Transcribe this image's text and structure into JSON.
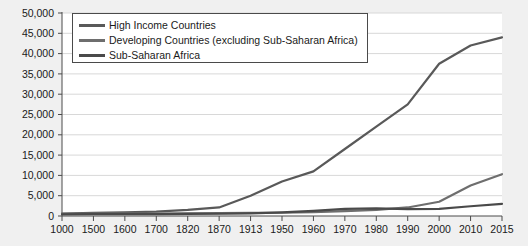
{
  "chart_data": {
    "type": "line",
    "title": "",
    "subtitle": "",
    "xlabel": "",
    "ylabel": "",
    "grid": true,
    "legend_position": "top-left",
    "categories": [
      "1000",
      "1500",
      "1600",
      "1700",
      "1820",
      "1870",
      "1913",
      "1950",
      "1960",
      "1970",
      "1980",
      "1990",
      "2000",
      "2010",
      "2015"
    ],
    "ylim": [
      0,
      50000
    ],
    "ytick_labels": [
      "0",
      "5,000",
      "10,000",
      "15,000",
      "20,000",
      "25,000",
      "30,000",
      "35,000",
      "40,000",
      "45,000",
      "50,000"
    ],
    "ytick_values": [
      0,
      5000,
      10000,
      15000,
      20000,
      25000,
      30000,
      35000,
      40000,
      45000,
      50000
    ],
    "series": [
      {
        "name": "High Income Countries",
        "color": "#595959",
        "values": [
          600,
          800,
          900,
          1100,
          1500,
          2100,
          5000,
          8500,
          11000,
          16500,
          22000,
          27500,
          37500,
          42000,
          44000
        ]
      },
      {
        "name": "Developing Countries (excluding Sub-Saharan Africa)",
        "color": "#6e6e6e",
        "values": [
          550,
          600,
          600,
          620,
          650,
          700,
          750,
          800,
          950,
          1200,
          1500,
          2100,
          3500,
          7500,
          10300
        ]
      },
      {
        "name": "Sub-Saharan Africa",
        "color": "#4a4a4a",
        "values": [
          420,
          450,
          450,
          480,
          500,
          550,
          650,
          900,
          1250,
          1750,
          1900,
          1700,
          1750,
          2400,
          3000
        ]
      }
    ]
  },
  "legend": {
    "items": [
      {
        "label": "High Income Countries",
        "color": "#595959"
      },
      {
        "label": "Developing Countries (excluding Sub-Saharan Africa)",
        "color": "#6e6e6e"
      },
      {
        "label": "Sub-Saharan Africa",
        "color": "#4a4a4a"
      }
    ]
  },
  "axes": {
    "x_ticks": [
      "1000",
      "1500",
      "1600",
      "1700",
      "1820",
      "1870",
      "1913",
      "1950",
      "1960",
      "1970",
      "1980",
      "1990",
      "2000",
      "2010",
      "2015"
    ],
    "y_ticks": [
      "50,000",
      "45,000",
      "40,000",
      "35,000",
      "30,000",
      "25,000",
      "20,000",
      "15,000",
      "10,000",
      "5,000",
      "0"
    ]
  },
  "colors": {
    "page_background": "#f0f0f0",
    "plot_background": "#ffffff",
    "gridline": "#d8d8d8",
    "axis": "#4a4a4a",
    "text": "#1a1a1a"
  }
}
